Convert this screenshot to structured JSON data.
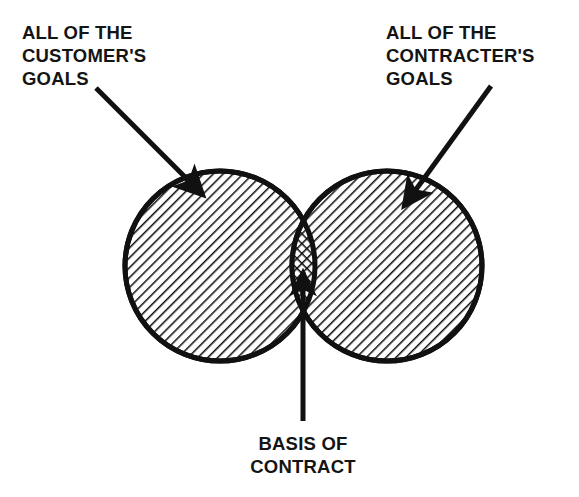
{
  "figure": {
    "type": "venn-diagram",
    "background_color": "#ffffff",
    "ink_color": "#111111"
  },
  "labels": {
    "left": {
      "name": "customer-goals-label",
      "lines": [
        "ALL OF THE",
        "CUSTOMER'S",
        "GOALS"
      ],
      "line1": "ALL OF THE",
      "line2": "CUSTOMER'S",
      "line3": "GOALS"
    },
    "right": {
      "name": "contracter-goals-label",
      "lines": [
        "ALL OF THE",
        "CONTRACTER'S",
        "GOALS"
      ],
      "line1": "ALL OF THE",
      "line2": "CONTRACTER'S",
      "line3": "GOALS"
    },
    "bottom": {
      "name": "basis-of-contract-label",
      "lines": [
        "BASIS OF",
        "CONTRACT"
      ],
      "line1": "BASIS OF",
      "line2": "CONTRACT"
    }
  },
  "shapes": {
    "left_circle": {
      "name": "customer-goals-circle",
      "cx": 220,
      "cy": 266,
      "r": 96,
      "fill": "diagonal-hatch",
      "hatch_direction": "descending-right",
      "stroke_width": 5
    },
    "right_circle": {
      "name": "contracter-goals-circle",
      "cx": 387,
      "cy": 266,
      "r": 96,
      "fill": "diagonal-hatch",
      "hatch_direction": "descending-right",
      "stroke_width": 5
    },
    "intersection": {
      "name": "basis-of-contract-region",
      "fill": "cross-hatch",
      "description": "narrow lens where the two circles overlap"
    }
  },
  "leaders": [
    {
      "name": "customer-goals-leader",
      "from_x": 96,
      "from_y": 88,
      "to_x": 203,
      "to_y": 195,
      "arrow": "filled-triangle"
    },
    {
      "name": "contracter-goals-leader",
      "from_x": 491,
      "from_y": 86,
      "to_x": 404,
      "to_y": 206,
      "arrow": "filled-triangle"
    },
    {
      "name": "basis-of-contract-leader",
      "from_x": 303,
      "from_y": 421,
      "to_x": 303,
      "to_y": 270,
      "arrow": "filled-triangle"
    }
  ]
}
